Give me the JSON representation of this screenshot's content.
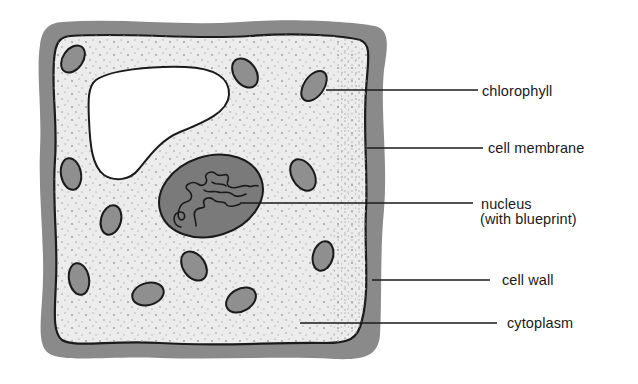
{
  "diagram": {
    "colors": {
      "background": "#ffffff",
      "cell_wall": "#8a8a8a",
      "cytoplasm": "#ececec",
      "vacuole": "#ffffff",
      "chloroplast": "#8f8f8f",
      "nucleus": "#7a7a7a",
      "outline": "#1a1a1a",
      "stipple": "#9a9a9a"
    },
    "labels": [
      {
        "id": "chlorophyll",
        "text": "chlorophyll",
        "x": 482,
        "y": 85,
        "line": {
          "x1": 326,
          "y1": 90,
          "x2": 478,
          "y2": 90
        }
      },
      {
        "id": "cell-membrane",
        "text": "cell membrane",
        "x": 488,
        "y": 142,
        "line": {
          "x1": 367,
          "y1": 148,
          "x2": 483,
          "y2": 148
        }
      },
      {
        "id": "nucleus",
        "text": "nucleus",
        "subtext": "(with blueprint)",
        "x": 481,
        "y": 198,
        "line": {
          "x1": 240,
          "y1": 203,
          "x2": 473,
          "y2": 203
        }
      },
      {
        "id": "cell-wall",
        "text": "cell wall",
        "x": 502,
        "y": 274,
        "line": {
          "x1": 372,
          "y1": 280,
          "x2": 490,
          "y2": 280
        }
      },
      {
        "id": "cytoplasm",
        "text": "cytoplasm",
        "x": 507,
        "y": 317,
        "line": {
          "x1": 300,
          "y1": 323,
          "x2": 497,
          "y2": 323
        }
      }
    ]
  }
}
